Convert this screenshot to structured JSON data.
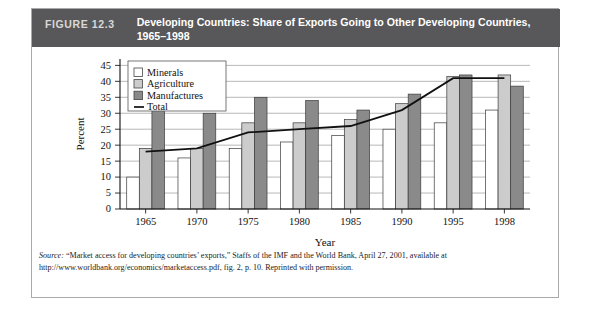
{
  "figure": {
    "number_label": "FIGURE 12.3",
    "title_line1": "Developing Countries: Share of Exports Going to Other Developing Countries,",
    "title_line2": "1965–1998",
    "header_bg": "#58585a",
    "number_color": "#d8d8d8",
    "title_color": "#ffffff"
  },
  "source": {
    "label": "Source:",
    "text": " “Market access for developing countries’ exports,” Staffs of the IMF and the World Bank, April 27, 2001, available at http://www.worldbank.org/economics/marketaccess.pdf, fig. 2, p. 10. Reprinted with permission."
  },
  "chart_data": {
    "type": "bar",
    "title": "Developing Countries: Share of Exports Going to Other Developing Countries, 1965–1998",
    "xlabel": "Year",
    "ylabel": "Percent",
    "categories": [
      "1965",
      "1970",
      "1975",
      "1980",
      "1985",
      "1990",
      "1995",
      "1998"
    ],
    "ylim": [
      0,
      47
    ],
    "yticks": [
      0,
      5,
      10,
      15,
      20,
      25,
      30,
      35,
      40,
      45
    ],
    "ytick_labels": [
      "0",
      "5",
      "10",
      "15",
      "20",
      "25",
      "30",
      "35",
      "40",
      "45"
    ],
    "grid": "horizontal",
    "legend_position": "upper-left-inside",
    "series": [
      {
        "name": "Minerals",
        "type": "bar",
        "fill": "#ffffff",
        "values": [
          10,
          16,
          19,
          21,
          23,
          25,
          27,
          31
        ]
      },
      {
        "name": "Agriculture",
        "type": "bar",
        "fill": "#cccccc",
        "values": [
          19,
          19,
          27,
          27,
          28,
          33,
          41.5,
          42
        ]
      },
      {
        "name": "Manufactures",
        "type": "bar",
        "fill": "#8a8a8a",
        "values": [
          31,
          30,
          35,
          34,
          31,
          36,
          42,
          38.5
        ]
      },
      {
        "name": "Total",
        "type": "line",
        "fill": "#111111",
        "values": [
          18,
          19,
          24,
          25,
          26,
          31,
          41,
          41
        ]
      }
    ]
  },
  "legend": {
    "items": [
      {
        "label": "Minerals",
        "swatch": "#ffffff"
      },
      {
        "label": "Agriculture",
        "swatch": "#cccccc"
      },
      {
        "label": "Manufactures",
        "swatch": "#8a8a8a"
      },
      {
        "label": "Total",
        "swatch": "line"
      }
    ]
  }
}
